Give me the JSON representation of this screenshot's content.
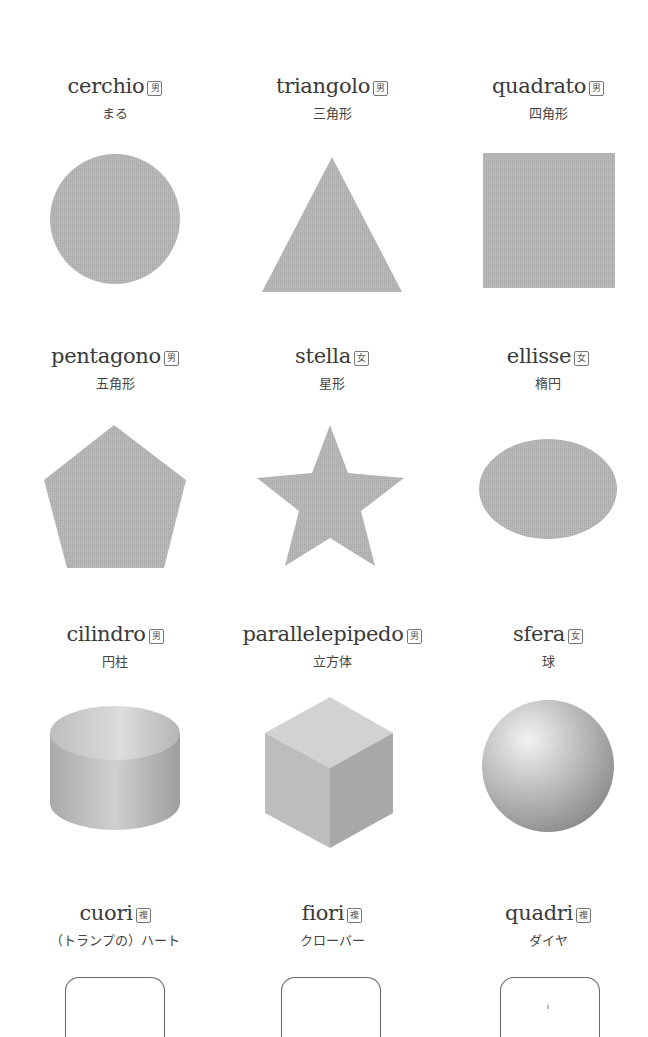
{
  "colors": {
    "shape_fill": "#b3b3b3",
    "text": "#3a3a3a",
    "card_border": "#666666"
  },
  "rows": [
    {
      "items": [
        {
          "word": "cerchio",
          "gender": "男",
          "gender_meaning": "masculine",
          "translation": "まる",
          "shape": "circle"
        },
        {
          "word": "triangolo",
          "gender": "男",
          "gender_meaning": "masculine",
          "translation": "三角形",
          "shape": "triangle"
        },
        {
          "word": "quadrato",
          "gender": "男",
          "gender_meaning": "masculine",
          "translation": "四角形",
          "shape": "square"
        }
      ]
    },
    {
      "items": [
        {
          "word": "pentagono",
          "gender": "男",
          "gender_meaning": "masculine",
          "translation": "五角形",
          "shape": "pentagon"
        },
        {
          "word": "stella",
          "gender": "女",
          "gender_meaning": "feminine",
          "translation": "星形",
          "shape": "star"
        },
        {
          "word": "ellisse",
          "gender": "女",
          "gender_meaning": "feminine",
          "translation": "楕円",
          "shape": "ellipse"
        }
      ]
    },
    {
      "items": [
        {
          "word": "cilindro",
          "gender": "男",
          "gender_meaning": "masculine",
          "translation": "円柱",
          "shape": "cylinder"
        },
        {
          "word": "parallelepipedo",
          "gender": "男",
          "gender_meaning": "masculine",
          "translation": "立方体",
          "shape": "cube"
        },
        {
          "word": "sfera",
          "gender": "女",
          "gender_meaning": "feminine",
          "translation": "球",
          "shape": "sphere"
        }
      ]
    },
    {
      "items": [
        {
          "word": "cuori",
          "gender": "複",
          "gender_meaning": "plural",
          "translation": "（トランプの）ハート",
          "shape": "card-hearts"
        },
        {
          "word": "fiori",
          "gender": "複",
          "gender_meaning": "plural",
          "translation": "クローバー",
          "shape": "card-clubs"
        },
        {
          "word": "quadri",
          "gender": "複",
          "gender_meaning": "plural",
          "translation": "ダイヤ",
          "shape": "card-diamonds"
        }
      ]
    }
  ]
}
